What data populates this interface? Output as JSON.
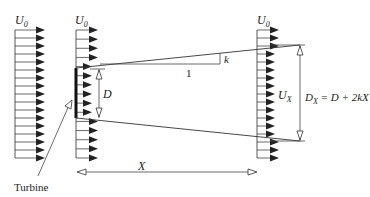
{
  "diagram": {
    "labels": {
      "u0_left": "U",
      "u0_left_sub": "0",
      "u0_mid": "U",
      "u0_mid_sub": "0",
      "u0_right": "U",
      "u0_right_sub": "0",
      "ux": "U",
      "ux_sub": "X",
      "d": "D",
      "slope_run": "1",
      "slope_rise": "k",
      "dx_lhs": "D",
      "dx_lhs_sub": "X",
      "dx_rhs": " = D + 2kX",
      "x_distance": "X",
      "turbine": "Turbine"
    },
    "columns": {
      "upstream": {
        "x": 15,
        "y_top": 30,
        "y_bottom": 158,
        "count": 17,
        "arrow_len": 30
      },
      "rotor": {
        "x": 76,
        "y_top": 30,
        "y_bottom": 158,
        "count": 15,
        "arrow_len": 22
      },
      "downstream": {
        "x": 257,
        "y_top": 30,
        "y_bottom": 158,
        "count": 17,
        "arrow_len": 22
      }
    },
    "colors": {
      "line": "#333333",
      "arrow": "#222222",
      "background": "#ffffff"
    }
  }
}
